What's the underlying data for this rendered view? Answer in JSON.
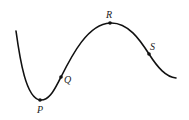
{
  "diagram": {
    "type": "curve-with-labeled-points",
    "curve_color": "#111111",
    "points": [
      {
        "id": "P",
        "label": "P",
        "description": "local minimum"
      },
      {
        "id": "Q",
        "label": "Q",
        "description": "point on rising segment"
      },
      {
        "id": "R",
        "label": "R",
        "description": "local maximum"
      },
      {
        "id": "S",
        "label": "S",
        "description": "point on falling segment"
      }
    ]
  }
}
